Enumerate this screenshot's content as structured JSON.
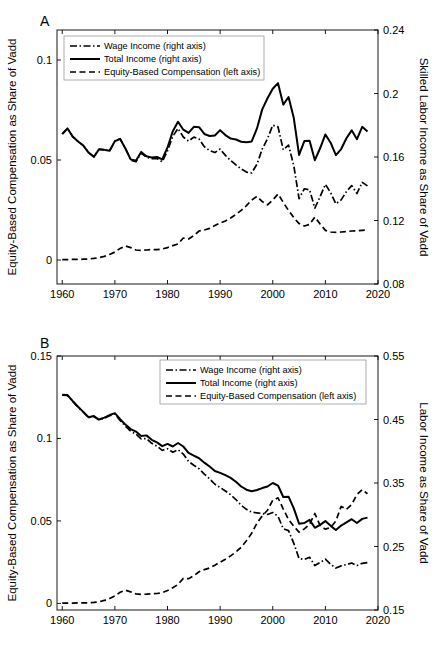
{
  "figure": {
    "background_color": "#ffffff",
    "line_color": "#000000",
    "panels": [
      "A",
      "B"
    ]
  },
  "panel_a": {
    "letter": "A",
    "left_axis_title": "Equity-Based Compensation as Share of Vadd",
    "right_axis_title": "Skilled Labor Income as Share of Vadd",
    "legend": [
      {
        "label": "Wage Income (right axis)",
        "style": "dashdot"
      },
      {
        "label": "Total Income (right axis)",
        "style": "solid"
      },
      {
        "label": "Equity-Based Compensation (left axis)",
        "style": "dashed"
      }
    ]
  },
  "panel_b": {
    "letter": "B",
    "left_axis_title": "Equity-Based Compensation as Share of Vadd",
    "right_axis_title": "Labor Income as Share of Vadd",
    "legend": [
      {
        "label": "Wage Income (right axis)",
        "style": "dashdot"
      },
      {
        "label": "Total Income (right axis)",
        "style": "solid"
      },
      {
        "label": "Equity-Based Compensation (left axis)",
        "style": "dashed"
      }
    ]
  },
  "chart_data": [
    {
      "type": "line",
      "panel": "A",
      "title": "",
      "xlabel": "",
      "ylabel": "Equity-Based Compensation as Share of Vadd",
      "y2label": "Skilled Labor Income as Share of Vadd",
      "grid": false,
      "legend_position": "top-left",
      "xlim": [
        1959,
        2020
      ],
      "xticks": [
        1960,
        1970,
        1980,
        1990,
        2000,
        2010,
        2020
      ],
      "ylim": [
        -0.012,
        0.115
      ],
      "yticks": [
        0,
        0.05,
        0.1
      ],
      "ytick_labels": [
        "0",
        "0.05",
        "0.1"
      ],
      "y2lim": [
        0.08,
        0.24
      ],
      "y2ticks": [
        0.08,
        0.12,
        0.16,
        0.2,
        0.24
      ],
      "y2tick_labels": [
        "0.08",
        "0.12",
        "0.16",
        "0.2",
        "0.24"
      ],
      "x": [
        1960,
        1961,
        1962,
        1963,
        1964,
        1965,
        1966,
        1967,
        1968,
        1969,
        1970,
        1971,
        1972,
        1973,
        1974,
        1975,
        1976,
        1977,
        1978,
        1979,
        1980,
        1981,
        1982,
        1983,
        1984,
        1985,
        1986,
        1987,
        1988,
        1989,
        1990,
        1991,
        1992,
        1993,
        1994,
        1995,
        1996,
        1997,
        1998,
        1999,
        2000,
        2001,
        2002,
        2003,
        2004,
        2005,
        2006,
        2007,
        2008,
        2009,
        2010,
        2011,
        2012,
        2013,
        2014,
        2015,
        2016,
        2017,
        2018
      ],
      "series": [
        {
          "name": "Total Income (right axis)",
          "axis": "right",
          "style": "solid",
          "values": [
            0.1745,
            0.178,
            0.1728,
            0.1698,
            0.1672,
            0.1628,
            0.1601,
            0.1649,
            0.1645,
            0.1639,
            0.17,
            0.1714,
            0.1654,
            0.1585,
            0.1577,
            0.1632,
            0.1605,
            0.1597,
            0.16,
            0.1585,
            0.166,
            0.1762,
            0.1822,
            0.1772,
            0.1752,
            0.179,
            0.1788,
            0.1745,
            0.1732,
            0.1735,
            0.1769,
            0.1738,
            0.1716,
            0.171,
            0.1696,
            0.1693,
            0.1698,
            0.178,
            0.19,
            0.197,
            0.203,
            0.2065,
            0.193,
            0.1978,
            0.1845,
            0.1613,
            0.17,
            0.1702,
            0.158,
            0.1655,
            0.1742,
            0.169,
            0.1612,
            0.165,
            0.1718,
            0.1768,
            0.1712,
            0.179,
            0.176
          ]
        },
        {
          "name": "Wage Income (right axis)",
          "axis": "right",
          "style": "dashdot",
          "values": [
            0.1745,
            0.178,
            0.1728,
            0.1698,
            0.1672,
            0.1628,
            0.1601,
            0.1649,
            0.1645,
            0.1639,
            0.17,
            0.1714,
            0.1654,
            0.158,
            0.157,
            0.1625,
            0.1598,
            0.159,
            0.159,
            0.157,
            0.164,
            0.173,
            0.178,
            0.1726,
            0.17,
            0.1725,
            0.1713,
            0.1665,
            0.164,
            0.1628,
            0.165,
            0.161,
            0.1578,
            0.155,
            0.1525,
            0.1505,
            0.15,
            0.1555,
            0.165,
            0.1715,
            0.18,
            0.179,
            0.1645,
            0.1675,
            0.1545,
            0.1338,
            0.14,
            0.1393,
            0.1278,
            0.135,
            0.1428,
            0.1375,
            0.1305,
            0.133,
            0.1382,
            0.142,
            0.137,
            0.144,
            0.1418
          ]
        },
        {
          "name": "Equity-Based Compensation (left axis)",
          "axis": "left",
          "style": "dashed",
          "values": [
            0.0002,
            0.0002,
            0.0003,
            0.0003,
            0.0004,
            0.0005,
            0.0008,
            0.0012,
            0.0018,
            0.0028,
            0.004,
            0.0058,
            0.007,
            0.0062,
            0.005,
            0.0048,
            0.005,
            0.0052,
            0.0052,
            0.0055,
            0.0062,
            0.0072,
            0.008,
            0.011,
            0.0105,
            0.0122,
            0.0145,
            0.015,
            0.0158,
            0.0172,
            0.0185,
            0.0195,
            0.021,
            0.0228,
            0.0248,
            0.0272,
            0.03,
            0.0318,
            0.0292,
            0.0276,
            0.03,
            0.033,
            0.0288,
            0.0248,
            0.0212,
            0.0182,
            0.017,
            0.0178,
            0.0215,
            0.018,
            0.0148,
            0.014,
            0.0138,
            0.014,
            0.0142,
            0.0145,
            0.0146,
            0.0148,
            0.015
          ]
        }
      ]
    },
    {
      "type": "line",
      "panel": "B",
      "title": "",
      "xlabel": "",
      "ylabel": "Equity-Based Compensation as Share of Vadd",
      "y2label": "Labor Income as Share of Vadd",
      "grid": false,
      "legend_position": "top-center",
      "xlim": [
        1959,
        2020
      ],
      "xticks": [
        1960,
        1970,
        1980,
        1990,
        2000,
        2010,
        2020
      ],
      "ylim": [
        -0.004,
        0.15
      ],
      "yticks": [
        0,
        0.05,
        0.1,
        0.15
      ],
      "ytick_labels": [
        "0",
        "0.05",
        "0.1",
        "0.15"
      ],
      "y2lim": [
        0.15,
        0.55
      ],
      "y2ticks": [
        0.15,
        0.25,
        0.35,
        0.45,
        0.55
      ],
      "y2tick_labels": [
        "0.15",
        "0.25",
        "0.35",
        "0.45",
        "0.55"
      ],
      "x": [
        1960,
        1961,
        1962,
        1963,
        1964,
        1965,
        1966,
        1967,
        1968,
        1969,
        1970,
        1971,
        1972,
        1973,
        1974,
        1975,
        1976,
        1977,
        1978,
        1979,
        1980,
        1981,
        1982,
        1983,
        1984,
        1985,
        1986,
        1987,
        1988,
        1989,
        1990,
        1991,
        1992,
        1993,
        1994,
        1995,
        1996,
        1997,
        1998,
        1999,
        2000,
        2001,
        2002,
        2003,
        2004,
        2005,
        2006,
        2007,
        2008,
        2009,
        2010,
        2011,
        2012,
        2013,
        2014,
        2015,
        2016,
        2017,
        2018
      ],
      "series": [
        {
          "name": "Total Income (right axis)",
          "axis": "right",
          "style": "solid",
          "values": [
            0.489,
            0.4885,
            0.479,
            0.47,
            0.462,
            0.4535,
            0.4555,
            0.45,
            0.453,
            0.457,
            0.46,
            0.4505,
            0.442,
            0.435,
            0.431,
            0.424,
            0.425,
            0.418,
            0.414,
            0.408,
            0.4115,
            0.4075,
            0.413,
            0.4075,
            0.3975,
            0.393,
            0.389,
            0.382,
            0.376,
            0.369,
            0.366,
            0.3625,
            0.358,
            0.352,
            0.3445,
            0.3395,
            0.337,
            0.339,
            0.342,
            0.3445,
            0.35,
            0.346,
            0.328,
            0.3285,
            0.31,
            0.286,
            0.287,
            0.292,
            0.2795,
            0.284,
            0.29,
            0.2825,
            0.276,
            0.283,
            0.288,
            0.293,
            0.287,
            0.2935,
            0.2955
          ]
        },
        {
          "name": "Wage Income (right axis)",
          "axis": "right",
          "style": "dashdot",
          "values": [
            0.4885,
            0.488,
            0.4785,
            0.4695,
            0.4615,
            0.453,
            0.4548,
            0.4492,
            0.452,
            0.4558,
            0.4588,
            0.4485,
            0.4395,
            0.4315,
            0.427,
            0.4195,
            0.42,
            0.4125,
            0.408,
            0.4015,
            0.404,
            0.3985,
            0.4025,
            0.3955,
            0.384,
            0.378,
            0.3725,
            0.364,
            0.3565,
            0.348,
            0.343,
            0.3375,
            0.3315,
            0.324,
            0.315,
            0.3085,
            0.304,
            0.303,
            0.302,
            0.3005,
            0.3035,
            0.2975,
            0.278,
            0.275,
            0.255,
            0.231,
            0.2295,
            0.233,
            0.22,
            0.225,
            0.23,
            0.222,
            0.216,
            0.2195,
            0.2215,
            0.224,
            0.22,
            0.2235,
            0.2245
          ]
        },
        {
          "name": "Equity-Based Compensation (left axis)",
          "axis": "left",
          "style": "dashed",
          "values": [
            0.0002,
            0.0002,
            0.0002,
            0.0003,
            0.0003,
            0.0004,
            0.0006,
            0.001,
            0.0018,
            0.003,
            0.0045,
            0.0068,
            0.008,
            0.007,
            0.0058,
            0.0055,
            0.0056,
            0.0058,
            0.006,
            0.0065,
            0.0078,
            0.0095,
            0.0115,
            0.0152,
            0.015,
            0.0168,
            0.0192,
            0.0205,
            0.0215,
            0.0232,
            0.025,
            0.0268,
            0.0288,
            0.0312,
            0.034,
            0.038,
            0.0425,
            0.0488,
            0.053,
            0.0565,
            0.0625,
            0.064,
            0.0572,
            0.0508,
            0.0468,
            0.0432,
            0.0452,
            0.048,
            0.0545,
            0.0472,
            0.045,
            0.046,
            0.05,
            0.0588,
            0.057,
            0.06,
            0.066,
            0.069,
            0.0665
          ]
        }
      ]
    }
  ]
}
